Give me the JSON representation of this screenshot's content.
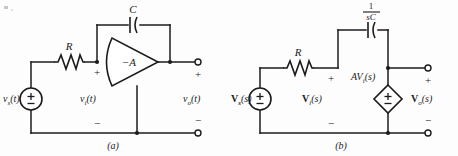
{
  "figure": {
    "background_color": "#fdfdfd",
    "ink_color": "#1b1b1b",
    "subfigures": [
      {
        "caption": "(a)",
        "domain": "time-domain",
        "source_label": "v",
        "source_sub": "s",
        "source_arg": "(t)",
        "source_symbol": "±",
        "resistor_label": "R",
        "capacitor_label": "C",
        "amp_label": "−A",
        "input_label": "v",
        "input_sub": "i",
        "input_arg": "(t)",
        "output_label": "v",
        "output_sub": "o",
        "output_arg": "(t)",
        "plus_sign": "+",
        "minus_sign": "−",
        "out_plus_sign": "+",
        "out_minus_sign": "−"
      },
      {
        "caption": "(b)",
        "domain": "s-domain",
        "source_label": "V",
        "source_sub": "s",
        "source_arg": "(s)",
        "source_symbol": "±",
        "resistor_label": "R",
        "impedance_numerator": "1",
        "impedance_denominator": "sC",
        "dependent_source_label": "AV",
        "dependent_source_sub": "i",
        "dependent_source_arg": "(s)",
        "dependent_source_symbol": "±",
        "input_label": "V",
        "input_sub": "i",
        "input_arg": "(s)",
        "output_label": "V",
        "output_sub": "o",
        "output_arg": "(s)",
        "plus_sign": "+",
        "minus_sign": "−",
        "out_plus_sign": "+",
        "out_minus_sign": "−"
      }
    ]
  }
}
